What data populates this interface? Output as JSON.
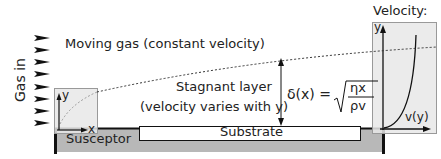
{
  "diagram": {
    "gas_inlet": {
      "label": "Gas in",
      "arrow_count": 8
    },
    "regions": {
      "moving_gas": "Moving gas (constant velocity)",
      "stagnant_layer_line1": "Stagnant layer",
      "stagnant_layer_line2": "(velocity varies with y)"
    },
    "components": {
      "substrate": "Substrate",
      "susceptor": "Susceptor"
    },
    "equation": {
      "lhs": "δ(x) =",
      "numerator": "ηx",
      "denominator": "ρv"
    },
    "left_inset": {
      "y_axis": "y",
      "x_axis": "x"
    },
    "velocity_profile": {
      "title": "Velocity:",
      "y_axis": "y",
      "x_axis": "v(y)"
    },
    "colors": {
      "inset_fill": "#e9e9e9",
      "susceptor_fill": "#b5b5b5",
      "line": "#111111",
      "boundary_dots": "#333333"
    }
  }
}
